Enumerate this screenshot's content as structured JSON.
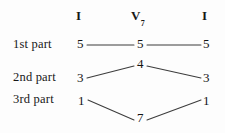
{
  "figure": {
    "type": "voice-leading-diagram",
    "columns": [
      {
        "id": "col-left",
        "label": "I",
        "subscript": ""
      },
      {
        "id": "col-mid",
        "label": "V",
        "subscript": "7"
      },
      {
        "id": "col-right",
        "label": "I",
        "subscript": ""
      }
    ],
    "rows": [
      {
        "id": "row-1",
        "label": "1st  part",
        "values": [
          "5",
          "5",
          "5"
        ]
      },
      {
        "id": "row-2",
        "label": "2nd  part",
        "values": [
          "3",
          "4",
          "3"
        ]
      },
      {
        "id": "row-3",
        "label": "3rd  part",
        "values": [
          "1",
          "7",
          "1"
        ]
      }
    ],
    "colors": {
      "ink": "#1a1a1a",
      "line": "#3c3c3c",
      "background": "#fdfdfd"
    }
  }
}
